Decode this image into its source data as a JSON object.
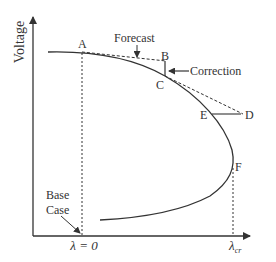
{
  "diagram": {
    "type": "continuation-power-flow",
    "axis_y_label": "Voltage",
    "axis_x_labels": {
      "origin": "λ = 0",
      "critical": "λ",
      "critical_sub": "cr"
    },
    "points": [
      {
        "id": "A",
        "label": "A",
        "role": "start point on PV curve"
      },
      {
        "id": "B",
        "label": "B",
        "role": "predicted point"
      },
      {
        "id": "C",
        "label": "C",
        "role": "corrected point"
      },
      {
        "id": "D",
        "label": "D",
        "role": "predicted point"
      },
      {
        "id": "E",
        "label": "E",
        "role": "corrected point"
      },
      {
        "id": "F",
        "label": "F",
        "role": "critical (nose) point"
      }
    ],
    "annotations": {
      "forecast": "Forecast",
      "correction": "Correction",
      "base_case_line1": "Base",
      "base_case_line2": "Case"
    },
    "colors": {
      "line": "#333333",
      "background": "#ffffff"
    }
  }
}
